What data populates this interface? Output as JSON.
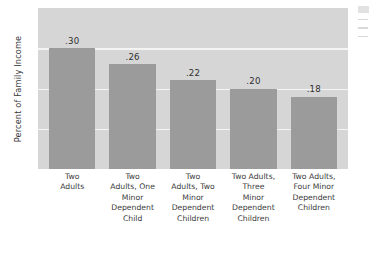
{
  "chart_data": {
    "type": "bar",
    "title": "",
    "xlabel": "",
    "ylabel": "Percent of Family Income",
    "categories": [
      "Two\nAdults",
      "Two\nAdults, One\nMinor\nDependent\nChild",
      "Two\nAdults, Two\nMinor\nDependent\nChildren",
      "Two Adults,\nThree\nMinor\nDependent\nChildren",
      "Two Adults,\nFour Minor\nDependent\nChildren"
    ],
    "values": [
      0.3,
      0.26,
      0.22,
      0.2,
      0.18
    ],
    "value_labels": [
      ".30",
      ".26",
      ".22",
      ".20",
      ".18"
    ],
    "ylim": [
      0,
      0.4
    ],
    "grid": true,
    "gridlines": [
      0.1,
      0.2,
      0.3
    ],
    "legend": "none",
    "tick_labels_y": [],
    "colors": {
      "bar": "#9b9b9b",
      "plot_background": "#d6d6d6",
      "gridline": "#f4f4f4",
      "text": "#3a3a3a",
      "page_background": "#ffffff"
    }
  }
}
